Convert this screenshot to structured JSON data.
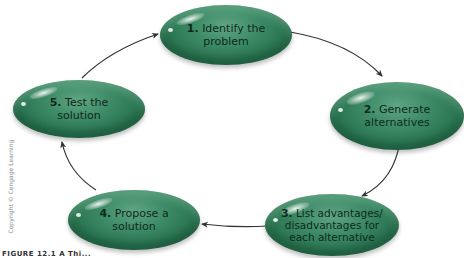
{
  "diagram": {
    "type": "cycle",
    "nodes": [
      {
        "id": 1,
        "number": "1.",
        "text_line1": "Identify the",
        "text_line2": "problem"
      },
      {
        "id": 2,
        "number": "2.",
        "text_line1": "Generate",
        "text_line2": "alternatives"
      },
      {
        "id": 3,
        "number": "3.",
        "text_line1": "List advantages/",
        "text_line2": "disadvantages for",
        "text_line3": "each alternative"
      },
      {
        "id": 4,
        "number": "4.",
        "text_line1": "Propose a",
        "text_line2": "solution"
      },
      {
        "id": 5,
        "number": "5.",
        "text_line1": "Test the",
        "text_line2": "solution"
      }
    ],
    "edges": [
      {
        "from": 1,
        "to": 2
      },
      {
        "from": 2,
        "to": 3
      },
      {
        "from": 3,
        "to": 4
      },
      {
        "from": 4,
        "to": 5
      },
      {
        "from": 5,
        "to": 1
      }
    ],
    "colors": {
      "node_fill": "#2f7a57",
      "arrow": "#333333",
      "text": "#0f2a1c"
    }
  },
  "copyright": "Copyright © Cengage Learning",
  "caption": "FIGURE 12.1  A Thi..."
}
